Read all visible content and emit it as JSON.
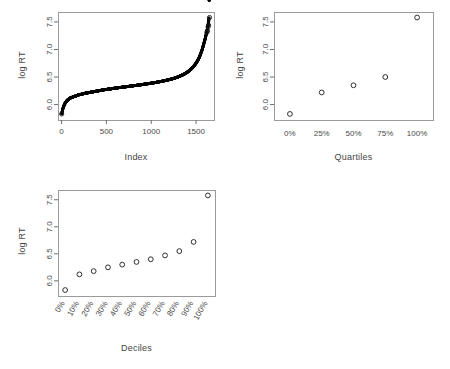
{
  "figure": {
    "background": "#ffffff",
    "point_color": "#000000",
    "box_color": "#9a9a9a",
    "panel_count": 3
  },
  "panels": [
    {
      "id": "index-panel",
      "ylabel": "log RT",
      "xlabel": "Index"
    },
    {
      "id": "quartiles-panel",
      "ylabel": "log RT",
      "xlabel": "Quartiles"
    },
    {
      "id": "deciles-panel",
      "ylabel": "log RT",
      "xlabel": "Deciles"
    }
  ],
  "footer": {
    "cropped_text": ""
  },
  "chart_data": [
    {
      "type": "scatter",
      "id": "index-panel",
      "title": "",
      "xlabel": "Index",
      "ylabel": "log RT",
      "xlim": [
        -40,
        1700
      ],
      "ylim": [
        5.72,
        7.68
      ],
      "xticks": [
        0,
        500,
        1000,
        1500
      ],
      "xtick_labels": [
        "0",
        "500",
        "1000",
        "1500"
      ],
      "yticks": [
        6.0,
        6.5,
        7.0,
        7.5
      ],
      "ytick_labels": [
        "6.0",
        "6.5",
        "7.0",
        "7.5"
      ],
      "grid": false,
      "legend": "none",
      "n_points": 1650,
      "description": "Sorted log reaction times plotted against rank index; dense S-shaped ogive with open-circle outliers at the upper tail.",
      "x": [
        1,
        17,
        34,
        50,
        66,
        83,
        99,
        116,
        132,
        149,
        165,
        182,
        198,
        215,
        231,
        248,
        264,
        281,
        297,
        314,
        330,
        347,
        363,
        380,
        396,
        413,
        429,
        446,
        462,
        479,
        495,
        512,
        528,
        545,
        561,
        578,
        594,
        611,
        627,
        644,
        660,
        677,
        693,
        710,
        726,
        743,
        759,
        776,
        792,
        809,
        825,
        842,
        858,
        875,
        891,
        908,
        924,
        941,
        957,
        974,
        990,
        1007,
        1023,
        1040,
        1056,
        1073,
        1089,
        1106,
        1122,
        1139,
        1155,
        1172,
        1188,
        1205,
        1221,
        1238,
        1254,
        1271,
        1287,
        1304,
        1320,
        1337,
        1353,
        1370,
        1386,
        1403,
        1419,
        1436,
        1452,
        1469,
        1485,
        1502,
        1518,
        1535,
        1551,
        1568,
        1584,
        1601,
        1617,
        1634,
        1645,
        1650
      ],
      "y": [
        5.83,
        5.94,
        6.01,
        6.05,
        6.08,
        6.1,
        6.12,
        6.13,
        6.14,
        6.15,
        6.16,
        6.17,
        6.18,
        6.185,
        6.19,
        6.2,
        6.205,
        6.21,
        6.215,
        6.22,
        6.225,
        6.23,
        6.235,
        6.24,
        6.245,
        6.25,
        6.255,
        6.26,
        6.265,
        6.27,
        6.273,
        6.277,
        6.281,
        6.285,
        6.289,
        6.293,
        6.297,
        6.3,
        6.304,
        6.308,
        6.311,
        6.315,
        6.318,
        6.322,
        6.325,
        6.329,
        6.332,
        6.336,
        6.339,
        6.343,
        6.346,
        6.35,
        6.354,
        6.357,
        6.361,
        6.365,
        6.369,
        6.373,
        6.377,
        6.381,
        6.385,
        6.389,
        6.394,
        6.398,
        6.403,
        6.408,
        6.413,
        6.418,
        6.423,
        6.429,
        6.435,
        6.441,
        6.447,
        6.454,
        6.461,
        6.468,
        6.476,
        6.485,
        6.494,
        6.504,
        6.515,
        6.527,
        6.54,
        6.554,
        6.57,
        6.588,
        6.608,
        6.63,
        6.655,
        6.684,
        6.717,
        6.755,
        6.8,
        6.853,
        6.918,
        6.997,
        7.09,
        7.19,
        7.3,
        7.44,
        7.58
      ],
      "outliers": {
        "x": [
          1650,
          1640,
          1634,
          1628,
          1620
        ],
        "y": [
          7.58,
          7.44,
          7.41,
          7.34,
          7.31
        ]
      }
    },
    {
      "type": "scatter",
      "id": "quartiles-panel",
      "title": "",
      "xlabel": "Quartiles",
      "ylabel": "log RT",
      "xlim": [
        -0.5,
        4.5
      ],
      "ylim": [
        5.72,
        7.68
      ],
      "categories": [
        "0%",
        "25%",
        "50%",
        "75%",
        "100%"
      ],
      "xtick_labels": [
        "0%",
        "25%",
        "50%",
        "75%",
        "100%"
      ],
      "yticks": [
        6.0,
        6.5,
        7.0,
        7.5
      ],
      "ytick_labels": [
        "6.0",
        "6.5",
        "7.0",
        "7.5"
      ],
      "grid": false,
      "legend": "none",
      "values": [
        5.83,
        6.22,
        6.35,
        6.5,
        7.58
      ],
      "marker": "open-circle"
    },
    {
      "type": "scatter",
      "id": "deciles-panel",
      "title": "",
      "xlabel": "Deciles",
      "ylabel": "log RT",
      "xlim": [
        -0.5,
        10.5
      ],
      "ylim": [
        5.72,
        7.68
      ],
      "categories": [
        "0%",
        "10%",
        "20%",
        "30%",
        "40%",
        "50%",
        "60%",
        "70%",
        "80%",
        "90%",
        "100%"
      ],
      "xtick_labels": [
        "0%",
        "10%",
        "20%",
        "30%",
        "40%",
        "50%",
        "60%",
        "70%",
        "80%",
        "90%",
        "100%"
      ],
      "yticks": [
        6.0,
        6.5,
        7.0,
        7.5
      ],
      "ytick_labels": [
        "6.0",
        "6.5",
        "7.0",
        "7.5"
      ],
      "grid": false,
      "legend": "none",
      "values": [
        5.83,
        6.12,
        6.18,
        6.25,
        6.3,
        6.35,
        6.4,
        6.47,
        6.55,
        6.72,
        7.58
      ],
      "marker": "open-circle"
    }
  ]
}
